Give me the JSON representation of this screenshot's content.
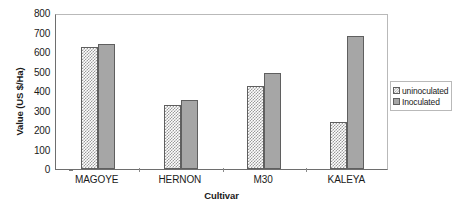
{
  "chart_data": {
    "type": "bar",
    "title": "",
    "xlabel": "Cultivar",
    "ylabel": "Value (US $/Ha)",
    "categories": [
      "MAGOYE",
      "HERNON",
      "M30",
      "KALEYA"
    ],
    "series": [
      {
        "name": "uninoculated",
        "values": [
          628,
          330,
          425,
          243
        ],
        "fill": "checkerboard",
        "color": "#9a9a9a"
      },
      {
        "name": "Inoculated",
        "values": [
          640,
          355,
          492,
          680
        ],
        "fill": "solid",
        "color": "#a6a6a6"
      }
    ],
    "ylim": [
      0,
      800
    ],
    "ytick_step": 100,
    "yticks": [
      0,
      100,
      200,
      300,
      400,
      500,
      600,
      700,
      800
    ],
    "ytick_labels": [
      "0",
      "100",
      "200",
      "300",
      "400",
      "500",
      "600",
      "700",
      "800"
    ],
    "grid": false,
    "legend_position": "right",
    "plot_border_color": "#b9b9b9",
    "axis_color": "#6e6e6e"
  },
  "legend": {
    "entries": [
      {
        "label": "uninoculated"
      },
      {
        "label": "Inoculated"
      }
    ]
  }
}
